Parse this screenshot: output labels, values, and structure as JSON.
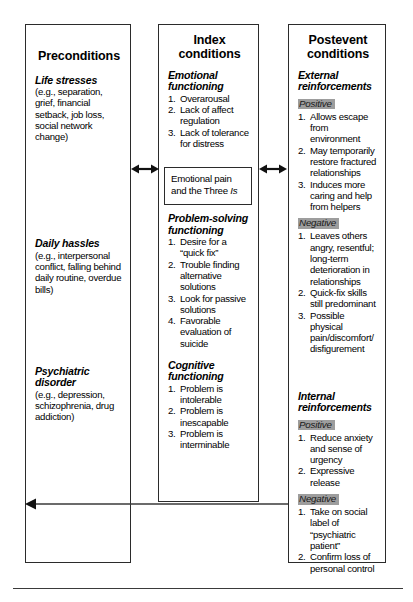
{
  "diagram": {
    "ink_color": "#2b2b2b",
    "highlight_color": "#9d9d9d"
  },
  "columns": [
    {
      "id": "preconditions",
      "title": "Preconditions",
      "sections": [
        {
          "heading": "Life stresses",
          "body": "(e.g., separation, grief, financial setback, job loss, social network change)"
        },
        {
          "heading": "Daily hassles",
          "body": "(e.g., interpersonal conflict, falling behind daily routine, overdue bills)"
        },
        {
          "heading": "Psychiatric disorder",
          "body": "(e.g., depression, schizophrenia, drug addiction)"
        }
      ]
    },
    {
      "id": "index-conditions",
      "title": "Index conditions",
      "sections": [
        {
          "heading": "Emotional functioning",
          "items": [
            "Overarousal",
            "Lack of affect regulation",
            "Lack of tolerance for distress"
          ]
        },
        {
          "heading": "Problem-solving functioning",
          "items": [
            "Desire for a “quick fix”",
            "Trouble finding alternative solutions",
            "Look for passive solutions",
            "Favorable evaluation of suicide"
          ]
        },
        {
          "heading": "Cognitive functioning",
          "items": [
            "Problem is intolerable",
            "Problem is inescapable",
            "Problem is interminable"
          ]
        }
      ]
    },
    {
      "id": "postevent-conditions",
      "title": "Postevent conditions",
      "sections": [
        {
          "heading": "External reinforcements",
          "groups": [
            {
              "label": "Positive",
              "items": [
                "Allows escape from environment",
                "May temporarily restore fractured relationships",
                "Induces more caring and help from helpers"
              ]
            },
            {
              "label": "Negative",
              "items": [
                "Leaves others angry, resentful; long-term deterioration in relationships",
                "Quick-fix skills still predominant",
                "Possible physical pain/discomfort/ disfigurement"
              ]
            }
          ]
        },
        {
          "heading": "Internal reinforcements",
          "groups": [
            {
              "label": "Positive",
              "items": [
                "Reduce anxiety and sense of urgency",
                "Expressive release"
              ]
            },
            {
              "label": "Negative",
              "items": [
                "Take on social label of “psychiatric patient”",
                "Confirm loss of personal control"
              ]
            }
          ]
        }
      ]
    }
  ],
  "inner_box": {
    "line1": "Emotional pain",
    "line2_prefix": "and the Three ",
    "line2_italic": "Is"
  },
  "numbers": {
    "n1": "1.",
    "n2": "2.",
    "n3": "3.",
    "n4": "4."
  }
}
